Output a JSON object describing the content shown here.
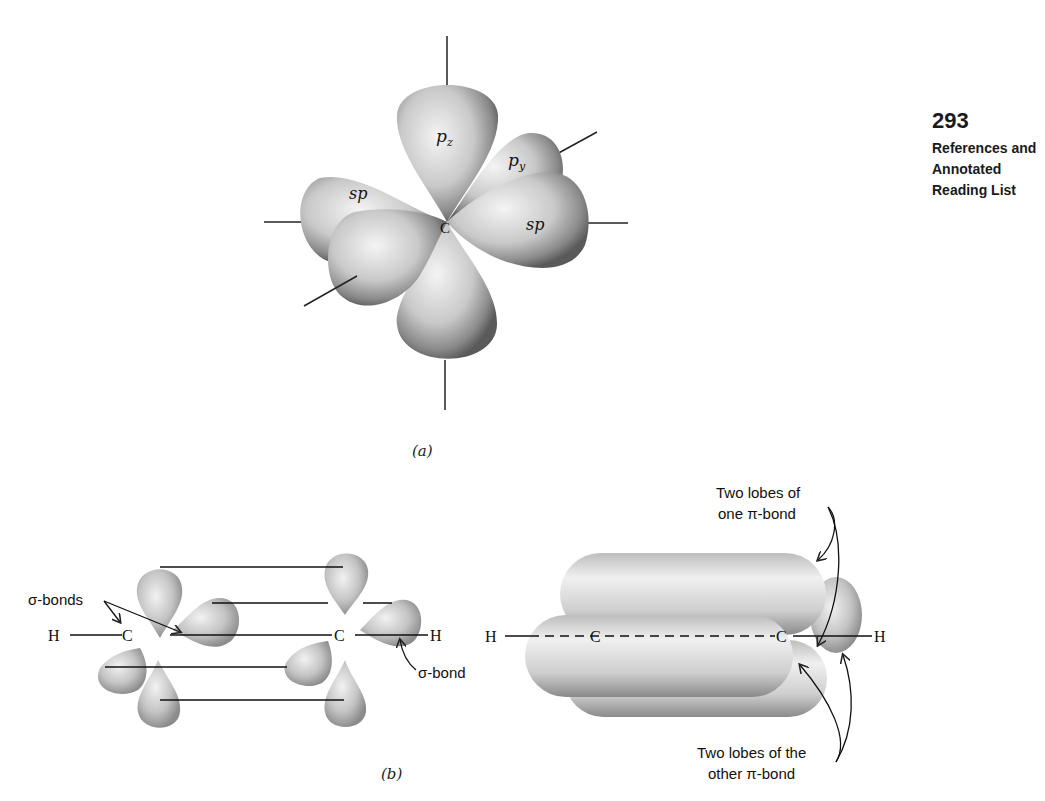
{
  "page": {
    "number": "293",
    "running_head": [
      "References and",
      "Annotated",
      "Reading List"
    ]
  },
  "figure_a": {
    "caption": "(a)",
    "center_atom": "C",
    "lobe_labels": {
      "pz": "p",
      "pz_sub": "z",
      "py": "p",
      "py_sub": "y",
      "sp_left": "sp",
      "sp_right": "sp"
    }
  },
  "figure_b": {
    "caption": "(b)",
    "left": {
      "atoms": [
        "H",
        "C",
        "C",
        "H"
      ],
      "annotation_sigma_bonds": "σ-bonds",
      "annotation_sigma_bond": "σ-bond"
    },
    "right": {
      "atoms": [
        "H",
        "C",
        "C",
        "H"
      ],
      "annotation_top": [
        "Two lobes of",
        "one π-bond"
      ],
      "annotation_bottom": [
        "Two lobes of the",
        "other π-bond"
      ]
    }
  }
}
